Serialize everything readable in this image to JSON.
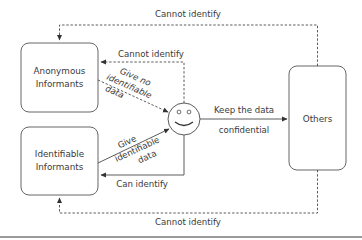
{
  "diagram": {
    "nodes": {
      "anonymous": {
        "line1": "Anonymous",
        "line2": "Informants"
      },
      "identifiable": {
        "line1": "Identifiable",
        "line2": "Informants"
      },
      "researcher": {
        "icon": "smiley-face-icon"
      },
      "others": {
        "label": "Others"
      }
    },
    "edges": {
      "top_outer": {
        "label": "Cannot identify",
        "style": "dashed",
        "from": "Others",
        "to": "Anonymous Informants"
      },
      "top_inner": {
        "label": "Cannot identify",
        "style": "dashed",
        "from": "Researcher",
        "to": "Anonymous Informants"
      },
      "give_no_data": {
        "line1": "Give no",
        "line2": "identifiable",
        "line3": "data",
        "style": "dashed",
        "from": "Anonymous Informants",
        "to": "Researcher"
      },
      "give_data": {
        "line1": "Give",
        "line2": "identifiable",
        "line3": "data",
        "style": "solid",
        "from": "Identifiable Informants",
        "to": "Researcher"
      },
      "can_identify": {
        "label": "Can identify",
        "style": "solid",
        "from": "Researcher",
        "to": "Identifiable Informants"
      },
      "keep_confidential": {
        "line1": "Keep the data",
        "line2": "confidential",
        "style": "solid",
        "from": "Researcher",
        "to": "Others"
      },
      "bottom_outer": {
        "label": "Cannot identify",
        "style": "dashed",
        "from": "Others",
        "to": "Identifiable Informants"
      }
    },
    "colors": {
      "stroke": "#4a4a4a",
      "text": "#3a3a3a",
      "background": "#ffffff",
      "rule": "#9a9a9a"
    }
  }
}
